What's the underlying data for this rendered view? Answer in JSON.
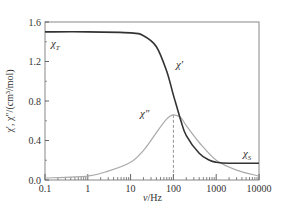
{
  "chart_data": {
    "type": "line",
    "title": "",
    "xlabel": "ν/Hz",
    "ylabel": "χ′, χ″/(cm³/mol)",
    "xscale": "log",
    "xlim": [
      0.1,
      10000
    ],
    "ylim": [
      0.0,
      1.6
    ],
    "xticks": [
      0.1,
      1,
      10,
      100,
      1000,
      10000
    ],
    "xtick_labels": [
      "0.1",
      "1",
      "10",
      "100",
      "1000",
      "10000"
    ],
    "yticks": [
      0.0,
      0.4,
      0.8,
      1.2,
      1.6
    ],
    "ytick_labels": [
      "0.0",
      "0.4",
      "0.8",
      "1.2",
      "1.6"
    ],
    "grid": false,
    "legend": "none (inline labels)",
    "chi_T": 1.5,
    "chi_S": 0.17,
    "relaxation_frequency_hz": 100,
    "series": [
      {
        "name": "χ′",
        "color": "#333333",
        "x": [
          0.1,
          1,
          10,
          20,
          40,
          70,
          100,
          150,
          200,
          400,
          700,
          1000,
          2000,
          10000
        ],
        "values": [
          1.5,
          1.5,
          1.49,
          1.46,
          1.35,
          1.1,
          0.86,
          0.6,
          0.45,
          0.27,
          0.2,
          0.18,
          0.17,
          0.17
        ]
      },
      {
        "name": "χ″",
        "color": "#aaaaaa",
        "x": [
          0.1,
          1,
          3,
          10,
          20,
          40,
          70,
          100,
          150,
          200,
          400,
          1000,
          3000,
          10000
        ],
        "values": [
          0.02,
          0.04,
          0.09,
          0.18,
          0.3,
          0.48,
          0.62,
          0.66,
          0.63,
          0.55,
          0.38,
          0.2,
          0.1,
          0.04
        ]
      }
    ],
    "annotations": [
      {
        "text": "χ_T",
        "x": 0.15,
        "y": 1.39
      },
      {
        "text": "χ′",
        "x": 40,
        "y": 1.05
      },
      {
        "text": "χ″",
        "x": 35,
        "y": 0.72
      },
      {
        "text": "χ_S",
        "x": 3000,
        "y": 0.22
      },
      {
        "text": "dashed vertical line at ν = 100 Hz from χ″ peak to x-axis"
      }
    ]
  },
  "labels": {
    "xlabel_main": "ν",
    "xlabel_unit": "/Hz",
    "ylabel": "χ′, χ″/(cm³/mol)",
    "chi_T_main": "χ",
    "chi_T_sub": "T",
    "chi_S_main": "χ",
    "chi_S_sub": "S",
    "chi_prime": "χ′",
    "chi_double_prime": "χ″"
  }
}
